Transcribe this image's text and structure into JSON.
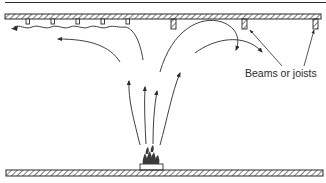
{
  "diagram": {
    "type": "fire-plume-ceiling-flow",
    "labels": {
      "beams": "Beams or joists"
    },
    "colors": {
      "line": "#2a2a2a",
      "background": "#ffffff"
    },
    "elements": {
      "ceiling": "hatched ceiling slab with small joists on left and deeper beams on right",
      "floor": "hatched floor slab",
      "fire_source": "burning object on a low platform",
      "plume_arrows": 4,
      "ceiling_jet_arrows": 4,
      "leader_lines": 2
    }
  }
}
